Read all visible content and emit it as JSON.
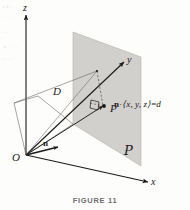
{
  "figure": {
    "caption": "FIGURE 11",
    "axes": {
      "z_label": "z",
      "y_label": "y",
      "x_label": "x"
    },
    "points": {
      "origin_label": "O",
      "point_p_label": "P"
    },
    "vectors": {
      "normal_label": "n",
      "distance_label": "D"
    },
    "plane": {
      "name_label": "P",
      "equation": {
        "normal": "n",
        "dot": "·",
        "vector": "⟨x, y, z⟩",
        "equals": "=",
        "value": "d"
      },
      "fill_color": "#d2d0cd",
      "edge_color": "#8d8b88"
    },
    "colors": {
      "ink": "#1a1a1a",
      "paper": "#fdfdfc",
      "smudge": "#cfcdc9"
    },
    "artifacts": {
      "top_left_1": "r l· .",
      "top_left_2": ". · .",
      "top_left_3": "·  ·",
      "top_left_4": "t. · · .",
      "left_mid": "·.  ..·· ·"
    }
  }
}
